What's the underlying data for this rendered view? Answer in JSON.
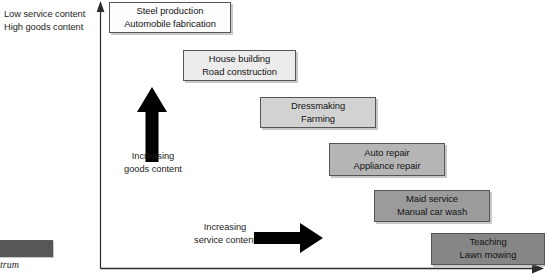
{
  "figure": {
    "type": "goods-services-continuum-diagram",
    "corner_label": {
      "line1": "Low service content",
      "line2": "High goods content"
    },
    "y_axis_note": {
      "line1": "Increasing",
      "line2": "goods content"
    },
    "x_axis_note": {
      "line1": "Increasing",
      "line2": "service content"
    },
    "caption": {
      "text": "trum"
    },
    "colors": {
      "box1_fill": "#fdfdfd",
      "box2_fill": "#ececec",
      "box3_fill": "#d2d2d2",
      "box4_fill": "#b5b5b5",
      "box5_fill": "#9b9b9b",
      "box6_fill": "#868686",
      "box_border": "#555555",
      "arrow": "#000000",
      "axis": "#2b2b2b",
      "caption_bar": "#575757"
    },
    "boxes": [
      {
        "name": "steel-production",
        "line1": "Steel production",
        "line2": "Automobile fabrication",
        "fill": "#fdfdfd",
        "x": 109,
        "y": 2,
        "w": 122,
        "h": 31
      },
      {
        "name": "house-building",
        "line1": "House building",
        "line2": "Road construction",
        "fill": "#ececec",
        "x": 183,
        "y": 50,
        "w": 113,
        "h": 31
      },
      {
        "name": "dressmaking",
        "line1": "Dressmaking",
        "line2": "Farming",
        "fill": "#d2d2d2",
        "x": 260,
        "y": 97,
        "w": 116,
        "h": 31
      },
      {
        "name": "auto-repair",
        "line1": "Auto repair",
        "line2": "Appliance repair",
        "fill": "#b5b5b5",
        "x": 329,
        "y": 143,
        "w": 116,
        "h": 33
      },
      {
        "name": "maid-service",
        "line1": "Maid service",
        "line2": "Manual car wash",
        "fill": "#9b9b9b",
        "x": 374,
        "y": 190,
        "w": 116,
        "h": 32
      },
      {
        "name": "teaching",
        "line1": "Teaching",
        "line2": "Lawn mowing",
        "fill": "#868686",
        "x": 431,
        "y": 233,
        "w": 114,
        "h": 32
      }
    ]
  }
}
